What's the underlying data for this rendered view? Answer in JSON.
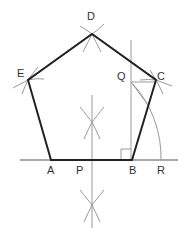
{
  "diagram": {
    "colors": {
      "polygon": "#222222",
      "construction": "#9a9a9a",
      "text": "#333333"
    },
    "labels": {
      "A": "A",
      "B": "B",
      "C": "C",
      "D": "D",
      "E": "E",
      "P": "P",
      "Q": "Q",
      "R": "R"
    },
    "polygon_vertices": [
      "A",
      "B",
      "C",
      "D",
      "E"
    ],
    "construction_elements": [
      "perpendicular bisector of AB through P",
      "perpendicular at B",
      "segment QC",
      "arc centered at A from Q to R",
      "right-angle mark at B"
    ]
  }
}
